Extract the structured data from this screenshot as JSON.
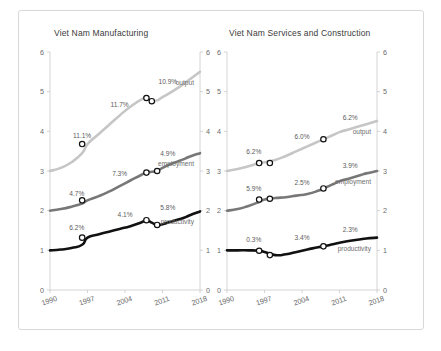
{
  "figure": {
    "background": "#ffffff",
    "border_color": "#d8d8d8"
  },
  "panels": [
    {
      "id": "manufacturing",
      "title": "Viet Nam Manufacturing",
      "series_labels": {
        "output": "output",
        "employment": "employment",
        "productivity": "productivity"
      }
    },
    {
      "id": "services",
      "title": "Viet Nam Services and Construction",
      "series_labels": {
        "output": "output",
        "employment": "employment",
        "productivity": "productivity"
      }
    }
  ],
  "axes": {
    "xticks": [
      "1990",
      "1997",
      "2004",
      "2011",
      "2018"
    ],
    "xtick_values": [
      1990,
      1997,
      2004,
      2011,
      2018
    ],
    "yticks": [
      "0",
      "1",
      "2",
      "3",
      "4",
      "5",
      "6"
    ],
    "ytick_values": [
      0,
      1,
      2,
      3,
      4,
      5,
      6
    ],
    "xlim": [
      1990,
      2018
    ],
    "ylim": [
      0,
      6
    ],
    "xlabel": "",
    "ylabel": "",
    "grid": false,
    "ytick_side": "both"
  },
  "colors": {
    "output": "#c6c6c6",
    "employment": "#777777",
    "productivity": "#111111",
    "axis": "#c9c9c9",
    "annotation_text": "#5c5c5c",
    "title_text": "#3a3a3a",
    "tick_text": "#6b6b6b",
    "marker_face": "#ffffff",
    "marker_edge": "#111111"
  },
  "chart_data": {
    "type": "line",
    "xlabel": "",
    "ylabel": "",
    "xlim": [
      1990,
      2018
    ],
    "ylim": [
      0,
      6
    ],
    "grid": false,
    "legend_position": "inline-at-line-end",
    "panels": [
      {
        "title": "Viet Nam Manufacturing",
        "x": [
          1990,
          1992,
          1994,
          1996,
          1997,
          1999,
          2001,
          2003,
          2005,
          2007,
          2008,
          2009,
          2010,
          2011,
          2013,
          2015,
          2016,
          2018
        ],
        "series": [
          {
            "name": "output",
            "color": "#c6c6c6",
            "values": [
              3.0,
              3.08,
              3.22,
              3.45,
              3.68,
              3.92,
              4.16,
              4.4,
              4.62,
              4.8,
              4.84,
              4.76,
              4.78,
              4.86,
              5.02,
              5.2,
              5.3,
              5.5
            ],
            "label_text": "output",
            "annotations": [
              {
                "text": "11.1%",
                "at_x": 1996,
                "at_y": 3.68
              },
              {
                "text": "11.7%",
                "at_x": 2003,
                "at_y": 4.45
              },
              {
                "text": "10.9%",
                "at_x": 2012,
                "at_y": 5.05
              }
            ],
            "markers": [
              {
                "x": 1996,
                "y": 3.68
              },
              {
                "x": 2008,
                "y": 4.84
              },
              {
                "x": 2009,
                "y": 4.76
              }
            ]
          },
          {
            "name": "employment",
            "color": "#777777",
            "values": [
              2.0,
              2.04,
              2.1,
              2.18,
              2.26,
              2.36,
              2.48,
              2.62,
              2.76,
              2.9,
              2.96,
              2.98,
              3.0,
              3.08,
              3.2,
              3.3,
              3.36,
              3.45
            ],
            "label_text": "employment",
            "annotations": [
              {
                "text": "4.7%",
                "at_x": 1995,
                "at_y": 2.22
              },
              {
                "text": "7.3%",
                "at_x": 2003,
                "at_y": 2.72
              },
              {
                "text": "4.9%",
                "at_x": 2012,
                "at_y": 3.22
              }
            ],
            "markers": [
              {
                "x": 1996,
                "y": 2.26
              },
              {
                "x": 2008,
                "y": 2.96
              },
              {
                "x": 2010,
                "y": 3.0
              }
            ]
          },
          {
            "name": "productivity",
            "color": "#111111",
            "values": [
              1.0,
              1.02,
              1.06,
              1.14,
              1.32,
              1.4,
              1.47,
              1.54,
              1.61,
              1.7,
              1.76,
              1.7,
              1.64,
              1.66,
              1.74,
              1.82,
              1.88,
              1.98
            ],
            "label_text": "productivity",
            "annotations": [
              {
                "text": "6.2%",
                "at_x": 1995,
                "at_y": 1.36
              },
              {
                "text": "4.1%",
                "at_x": 2004,
                "at_y": 1.7
              },
              {
                "text": "5.8%",
                "at_x": 2012,
                "at_y": 1.86
              }
            ],
            "markers": [
              {
                "x": 1996,
                "y": 1.32
              },
              {
                "x": 2008,
                "y": 1.76
              },
              {
                "x": 2010,
                "y": 1.64
              }
            ]
          }
        ]
      },
      {
        "title": "Viet Nam Services and Construction",
        "x": [
          1990,
          1992,
          1994,
          1996,
          1997,
          1999,
          2001,
          2003,
          2005,
          2007,
          2008,
          2009,
          2010,
          2011,
          2013,
          2015,
          2016,
          2018
        ],
        "series": [
          {
            "name": "output",
            "color": "#c6c6c6",
            "values": [
              3.0,
              3.05,
              3.12,
              3.2,
              3.22,
              3.28,
              3.38,
              3.5,
              3.62,
              3.74,
              3.8,
              3.86,
              3.92,
              3.98,
              4.06,
              4.14,
              4.18,
              4.26
            ],
            "label_text": "output",
            "annotations": [
              {
                "text": "6.2%",
                "at_x": 1995,
                "at_y": 3.28
              },
              {
                "text": "6.0%",
                "at_x": 2004,
                "at_y": 3.66
              },
              {
                "text": "6.2%",
                "at_x": 2013,
                "at_y": 4.14
              }
            ],
            "markers": [
              {
                "x": 1996,
                "y": 3.2
              },
              {
                "x": 1998,
                "y": 3.2
              },
              {
                "x": 2008,
                "y": 3.8
              }
            ]
          },
          {
            "name": "employment",
            "color": "#777777",
            "values": [
              2.0,
              2.04,
              2.12,
              2.22,
              2.28,
              2.32,
              2.34,
              2.38,
              2.42,
              2.5,
              2.56,
              2.62,
              2.68,
              2.74,
              2.82,
              2.9,
              2.94,
              3.0
            ],
            "label_text": "employment",
            "annotations": [
              {
                "text": "5.9%",
                "at_x": 1995,
                "at_y": 2.34
              },
              {
                "text": "2.5%",
                "at_x": 2004,
                "at_y": 2.5
              },
              {
                "text": "3.9%",
                "at_x": 2013,
                "at_y": 2.92
              }
            ],
            "markers": [
              {
                "x": 1996,
                "y": 2.28
              },
              {
                "x": 1998,
                "y": 2.3
              },
              {
                "x": 2008,
                "y": 2.56
              }
            ]
          },
          {
            "name": "productivity",
            "color": "#111111",
            "values": [
              1.0,
              1.0,
              1.0,
              0.99,
              0.96,
              0.88,
              0.9,
              0.96,
              1.02,
              1.08,
              1.1,
              1.13,
              1.16,
              1.19,
              1.24,
              1.28,
              1.3,
              1.32
            ],
            "label_text": "productivity",
            "annotations": [
              {
                "text": "0.3%",
                "at_x": 1995,
                "at_y": 1.06
              },
              {
                "text": "3.4%",
                "at_x": 2004,
                "at_y": 1.1
              },
              {
                "text": "2.3%",
                "at_x": 2013,
                "at_y": 1.32
              }
            ],
            "markers": [
              {
                "x": 1996,
                "y": 0.99
              },
              {
                "x": 1998,
                "y": 0.88
              },
              {
                "x": 2008,
                "y": 1.1
              }
            ]
          }
        ]
      }
    ]
  }
}
